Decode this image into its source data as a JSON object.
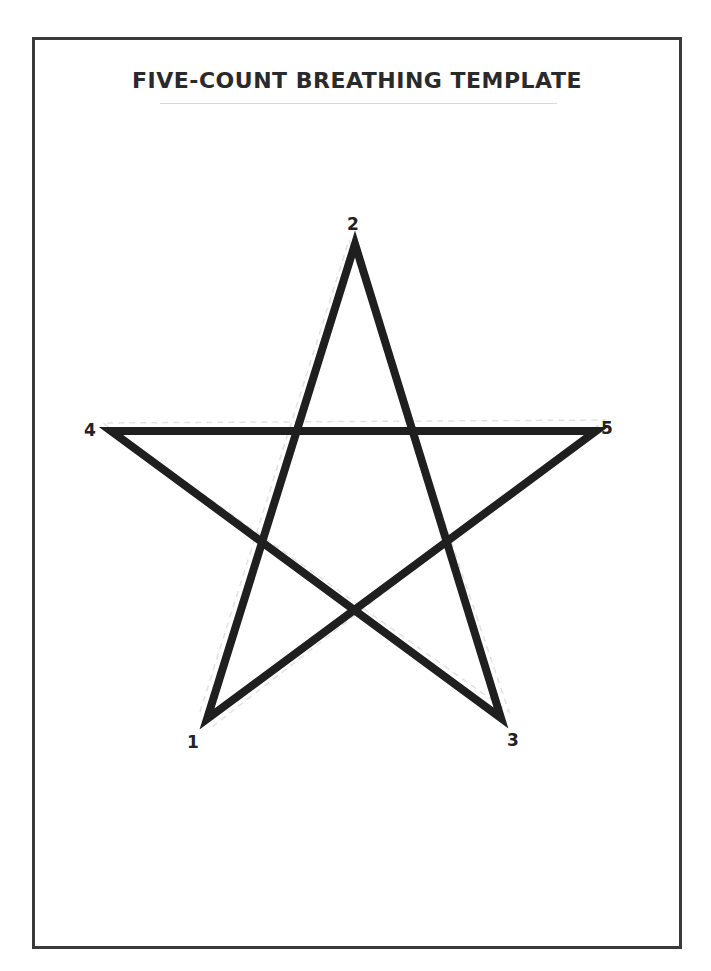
{
  "document": {
    "title": "FIVE-COUNT BREATHING TEMPLATE"
  },
  "star": {
    "stroke_color": "#1f1f1f",
    "guide_color": "#e0e0e0",
    "vertices": [
      {
        "label": "1",
        "x": 207,
        "y": 719
      },
      {
        "label": "2",
        "x": 355,
        "y": 244
      },
      {
        "label": "3",
        "x": 501,
        "y": 718
      },
      {
        "label": "4",
        "x": 111,
        "y": 431
      },
      {
        "label": "5",
        "x": 596,
        "y": 431
      }
    ],
    "path_order": [
      "1",
      "2",
      "3",
      "4",
      "5",
      "1"
    ]
  }
}
